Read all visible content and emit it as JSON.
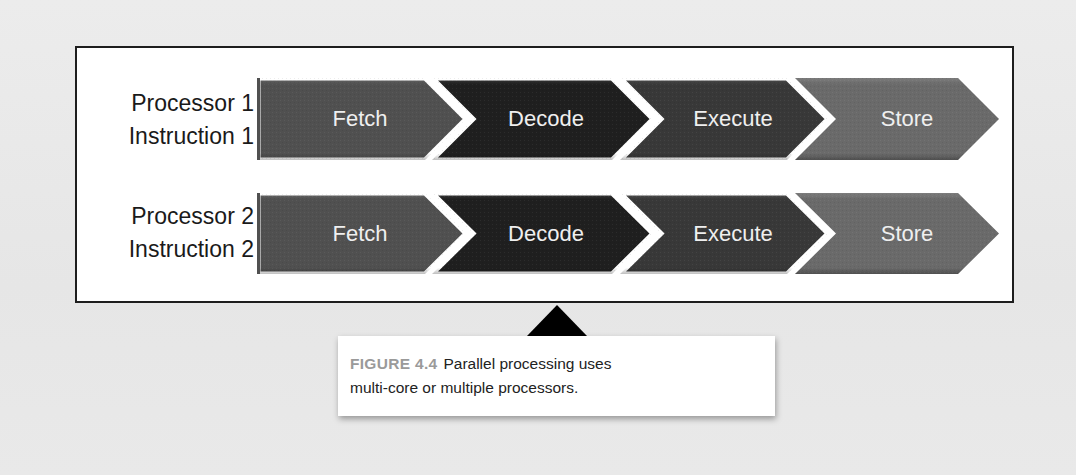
{
  "diagram": {
    "rows": [
      {
        "label_line1": "Processor 1",
        "label_line2": "Instruction 1",
        "stages": [
          {
            "label": "Fetch",
            "color": "#505050"
          },
          {
            "label": "Decode",
            "color": "#1f1f1f"
          },
          {
            "label": "Execute",
            "color": "#383838"
          },
          {
            "label": "Store",
            "color": "#6a6a6a"
          }
        ]
      },
      {
        "label_line1": "Processor 2",
        "label_line2": "Instruction 2",
        "stages": [
          {
            "label": "Fetch",
            "color": "#505050"
          },
          {
            "label": "Decode",
            "color": "#1f1f1f"
          },
          {
            "label": "Execute",
            "color": "#383838"
          },
          {
            "label": "Store",
            "color": "#6a6a6a"
          }
        ]
      }
    ],
    "colors": {
      "frame_border": "#1e1e1e",
      "frame_background": "#ffffff",
      "stage_text": "#efefef",
      "separator": "#ffffff"
    }
  },
  "caption": {
    "figure_label": "FIGURE 4.4",
    "text": "Parallel processing uses multi-core or multiple processors.",
    "line1": "Parallel processing uses",
    "line2": "multi-core or multiple processors.",
    "figure_label_color": "#9a9a9a"
  },
  "page": {
    "background": "#e9e9e9"
  }
}
